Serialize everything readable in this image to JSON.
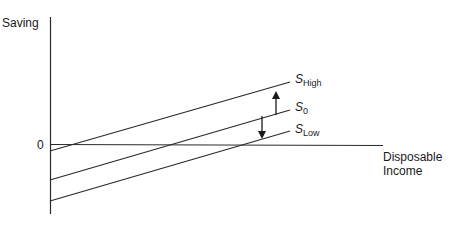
{
  "diagram": {
    "y_axis_label": "Saving",
    "x_axis_label_line1": "Disposable",
    "x_axis_label_line2": "Income",
    "origin_label": "0",
    "lines": [
      {
        "name": "S",
        "subscript": "High"
      },
      {
        "name": "S",
        "subscript": "0"
      },
      {
        "name": "S",
        "subscript": "Low"
      }
    ],
    "arrows": [
      {
        "direction": "up",
        "from": "S0",
        "to": "SHigh"
      },
      {
        "direction": "down",
        "from": "S0",
        "to": "SLow"
      }
    ],
    "line_color": "#2a2a2a"
  }
}
